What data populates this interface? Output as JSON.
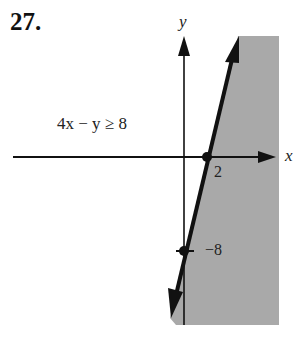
{
  "problem": {
    "number": "27.",
    "inequality": "4x − y ≥ 8"
  },
  "graph": {
    "x_axis_label": "x",
    "y_axis_label": "y",
    "x_intercept_label": "2",
    "y_intercept_label": "−8",
    "boundary_line": "4x − y = 8",
    "boundary_style": "solid",
    "shaded_region": "right of line (4x − y ≥ 8)",
    "shade_color": "#a9a9a9",
    "points": [
      {
        "x": 2,
        "y": 0
      },
      {
        "x": 0,
        "y": -8
      }
    ]
  }
}
